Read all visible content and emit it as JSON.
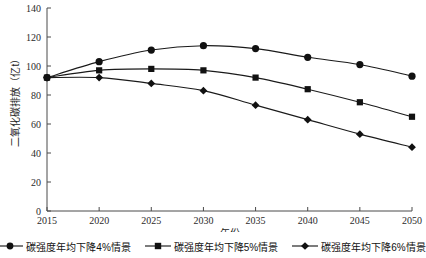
{
  "chart_data": {
    "type": "line",
    "title": "",
    "xlabel": "年份",
    "ylabel": "二氧化碳排放（亿t）",
    "x": [
      2015,
      2020,
      2025,
      2030,
      2035,
      2040,
      2045,
      2050
    ],
    "xlim": [
      2015,
      2050
    ],
    "ylim": [
      0,
      140
    ],
    "ytick_labels": [
      "0",
      "20",
      "40",
      "60",
      "80",
      "100",
      "120",
      "140"
    ],
    "yticks": [
      0,
      20,
      40,
      60,
      80,
      100,
      120,
      140
    ],
    "xtick_labels": [
      "2015",
      "2020",
      "2025",
      "2030",
      "2035",
      "2040",
      "2045",
      "2050"
    ],
    "grid": false,
    "legend_position": "bottom",
    "series": [
      {
        "name": "碳强度年均下降4%情景",
        "marker": "circle",
        "color": "#111111",
        "values": [
          92,
          103,
          111,
          114,
          112,
          106,
          101,
          93
        ]
      },
      {
        "name": "碳强度年均下降5%情景",
        "marker": "square",
        "color": "#111111",
        "values": [
          92,
          97,
          98,
          97,
          92,
          84,
          75,
          65
        ]
      },
      {
        "name": "碳强度年均下降6%情景",
        "marker": "diamond",
        "color": "#111111",
        "values": [
          92,
          92,
          88,
          83,
          73,
          63,
          53,
          44
        ]
      }
    ]
  },
  "legend": {
    "items": [
      {
        "label": "碳强度年均下降4%情景",
        "marker": "circle"
      },
      {
        "label": "碳强度年均下降5%情景",
        "marker": "square"
      },
      {
        "label": "碳强度年均下降6%情景",
        "marker": "diamond"
      }
    ]
  }
}
